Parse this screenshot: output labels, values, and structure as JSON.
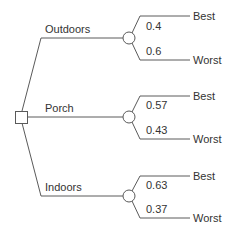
{
  "diagram": {
    "type": "decision-tree",
    "decision_node": {
      "shape": "square"
    },
    "branches": [
      {
        "label": "Outdoors",
        "outcomes": [
          {
            "label": "Best",
            "probability": "0.4"
          },
          {
            "label": "Worst",
            "probability": "0.6"
          }
        ]
      },
      {
        "label": "Porch",
        "outcomes": [
          {
            "label": "Best",
            "probability": "0.57"
          },
          {
            "label": "Worst",
            "probability": "0.43"
          }
        ]
      },
      {
        "label": "Indoors",
        "outcomes": [
          {
            "label": "Best",
            "probability": "0.63"
          },
          {
            "label": "Worst",
            "probability": "0.37"
          }
        ]
      }
    ]
  },
  "colors": {
    "line": "#5a5a5a",
    "text": "#333333",
    "background": "#ffffff"
  }
}
